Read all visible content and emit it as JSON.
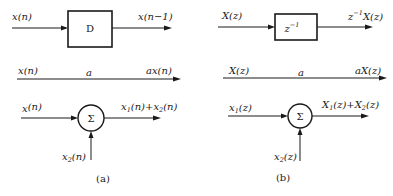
{
  "panels": {
    "a": {
      "caption": "(a)",
      "delay": {
        "input": "x(n)",
        "block": "D",
        "output": "x(n−1)"
      },
      "gain": {
        "input": "x(n)",
        "coefficient": "a",
        "output": "ax(n)"
      },
      "adder": {
        "input1_base": "x",
        "input1_sub": "",
        "input1_arg": "(n)",
        "symbol": "Σ",
        "output_t1_base": "x",
        "output_t1_sub": "1",
        "output_t1_arg": "(n)+",
        "output_t2_base": "x",
        "output_t2_sub": "2",
        "output_t2_arg": "(n)",
        "input2_base": "x",
        "input2_sub": "2",
        "input2_arg": "(n)"
      }
    },
    "b": {
      "caption": "(b)",
      "delay": {
        "input": "X(z)",
        "block_base": "z",
        "block_sup": "−1",
        "output_base": "z",
        "output_sup": "−1",
        "output_arg": "X(z)"
      },
      "gain": {
        "input": "X(z)",
        "coefficient": "a",
        "output": "aX(z)"
      },
      "adder": {
        "input1_base": "x",
        "input1_sub": "1",
        "input1_arg": "(z)",
        "symbol": "Σ",
        "output_t1_base": "X",
        "output_t1_sub": "1",
        "output_t1_arg": "(z)+",
        "output_t2_base": "X",
        "output_t2_sub": "2",
        "output_t2_arg": "(z)",
        "input2_base": "x",
        "input2_sub": "2",
        "input2_arg": "(z)"
      }
    }
  }
}
